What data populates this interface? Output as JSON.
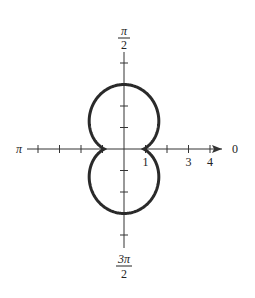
{
  "chart_data": {
    "type": "line",
    "coordinate_system": "polar",
    "title": "",
    "equation_shape": "figure-eight along vertical axis, symmetric about both axes",
    "curve": {
      "description": "approx r = 1 + 2|sin θ|",
      "r_at_theta_0": 1,
      "r_at_theta_pi_over_2": 3,
      "r_at_theta_3pi_over_2": 3,
      "max_horizontal_extent": 1.8
    },
    "axis_labels": {
      "right": "0",
      "left": "π",
      "top_num": "π",
      "top_den": "2",
      "bottom_num": "3π",
      "bottom_den": "2"
    },
    "radial_ticks": [
      1,
      2,
      3,
      4
    ],
    "tick_labels": [
      {
        "value": 1,
        "text": "1"
      },
      {
        "value": 3,
        "text": "3"
      },
      {
        "value": 4,
        "text": "4"
      }
    ],
    "rmax": 4,
    "grid": false
  }
}
